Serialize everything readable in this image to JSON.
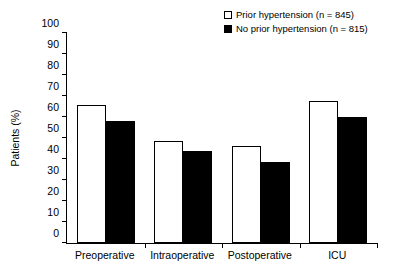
{
  "chart_data": {
    "type": "bar",
    "title": "",
    "subtitle": "",
    "xlabel": "",
    "ylabel": "Patients (%)",
    "ylim": [
      0,
      100
    ],
    "ytick_step": 10,
    "yticks": [
      0,
      10,
      20,
      30,
      40,
      50,
      60,
      70,
      80,
      90,
      100
    ],
    "categories": [
      "Preoperative",
      "Intraoperative",
      "Postoperative",
      "ICU"
    ],
    "grid": false,
    "legend_position": "top-right",
    "series": [
      {
        "name": "Prior hypertension (n = 845)",
        "style": "open",
        "color": "#ffffff",
        "edge_color": "#000000",
        "values": [
          65.5,
          48.5,
          46.0,
          67.5
        ]
      },
      {
        "name": "No prior hypertension (n = 815)",
        "style": "filled",
        "color": "#000000",
        "edge_color": "#000000",
        "values": [
          58.0,
          44.0,
          38.5,
          60.0
        ]
      }
    ]
  },
  "legend": {
    "items": [
      {
        "marker": "open-square-icon",
        "label": "Prior hypertension (n = 845)"
      },
      {
        "marker": "filled-square-icon",
        "label": "No prior hypertension (n = 815)"
      }
    ]
  },
  "axes": {
    "y_title": "Patients (%)",
    "y_tick_labels": [
      "100",
      "90",
      "80",
      "70",
      "60",
      "50",
      "40",
      "30",
      "20",
      "10",
      "0"
    ],
    "x_tick_labels": [
      "Preoperative",
      "Intraoperative",
      "Postoperative",
      "ICU"
    ]
  }
}
